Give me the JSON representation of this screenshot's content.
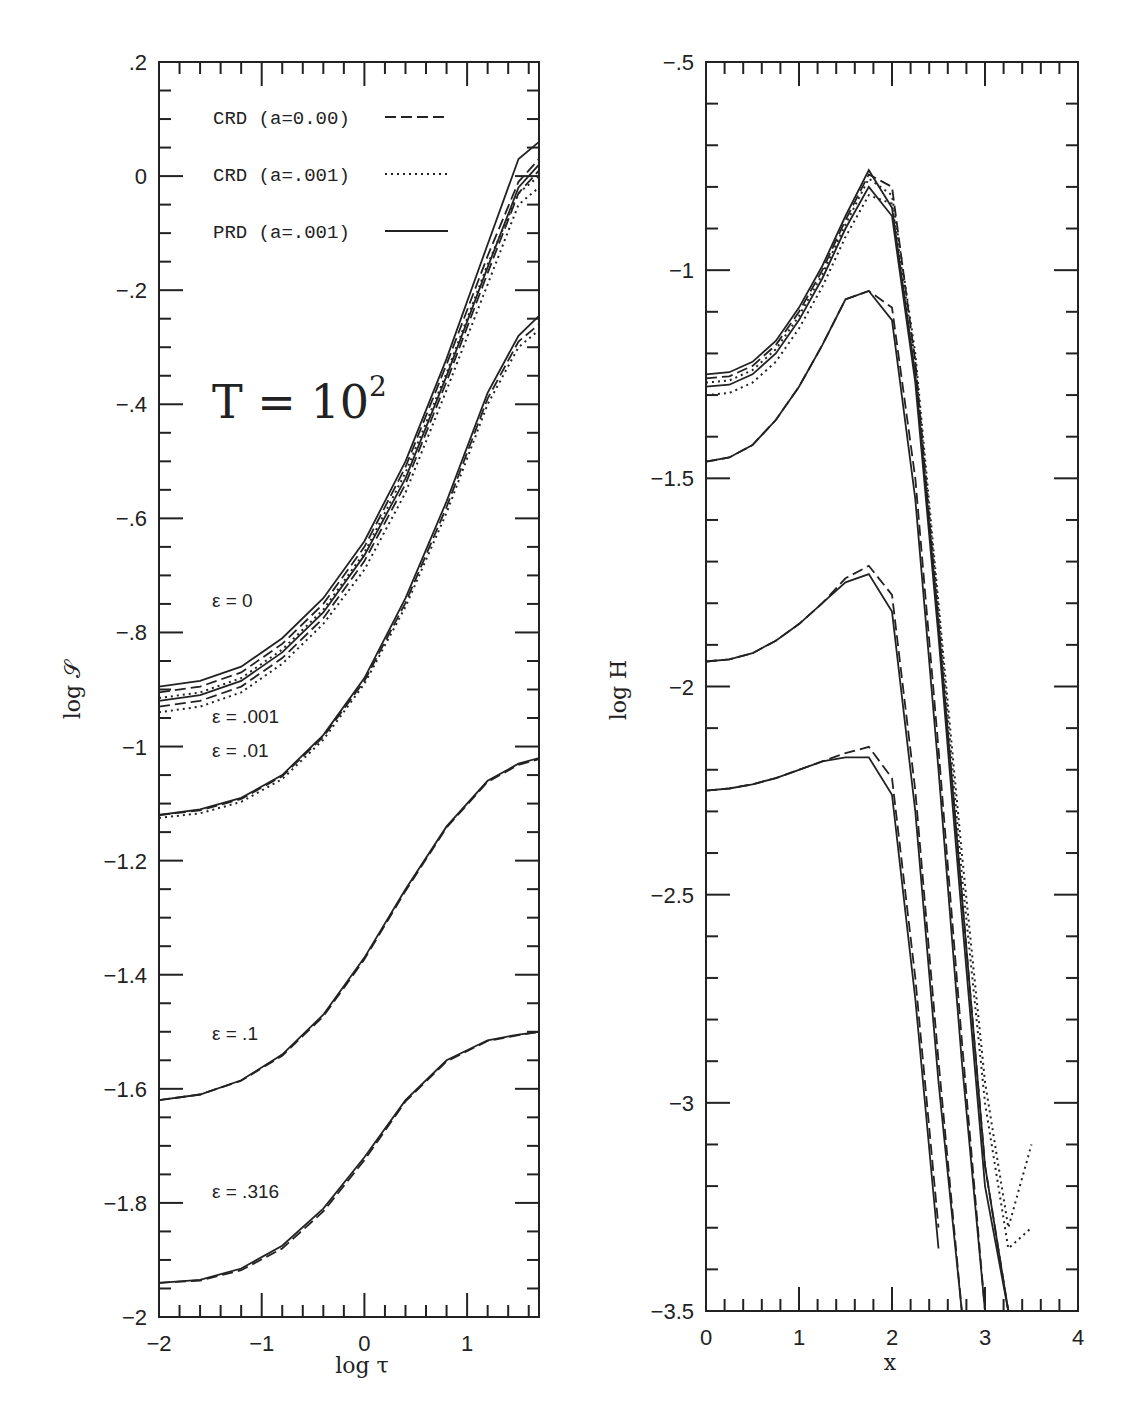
{
  "figure": {
    "left_panel": {
      "xlabel": "log τ",
      "ylabel": "log 𝒮",
      "annotation_big": "T = 10",
      "annotation_big_sup": "2",
      "legend": [
        {
          "label": "CRD (a=0.00)",
          "style": "dashed"
        },
        {
          "label": "CRD (a=.001)",
          "style": "dotted"
        },
        {
          "label": "PRD (a=.001)",
          "style": "solid"
        }
      ],
      "epsilon_labels": [
        "ε = 0",
        "ε = .001",
        "ε = .01",
        "ε = .1",
        "ε = .316"
      ]
    },
    "right_panel": {
      "xlabel": "x",
      "ylabel": "log H"
    }
  },
  "chart_data": [
    {
      "type": "line",
      "title": "T = 10^2",
      "xlabel": "log τ",
      "ylabel": "log 𝒮",
      "xlim": [
        -2,
        1.7
      ],
      "ylim": [
        -2,
        0.2
      ],
      "xticks": [
        "-2",
        "-1",
        "0",
        "1"
      ],
      "yticks": [
        ".2",
        "0",
        "-.2",
        "-.4",
        "-.6",
        "-.8",
        "-1",
        "-1.2",
        "-1.4",
        "-1.6",
        "-1.8",
        "-2"
      ],
      "grid": false,
      "legend_position": "upper left",
      "legend": [
        "CRD (a=0.00)",
        "CRD (a=.001)",
        "PRD (a=.001)"
      ],
      "annotations": [
        "T = 10^2",
        "ε = 0",
        "ε = .001",
        "ε = .01",
        "ε = .1",
        "ε = .316"
      ],
      "x": [
        -2.0,
        -1.6,
        -1.2,
        -0.8,
        -0.4,
        0.0,
        0.4,
        0.8,
        1.2,
        1.5,
        1.7
      ],
      "series": [
        {
          "name": "ε=0 PRD",
          "style": "solid",
          "values": [
            -0.895,
            -0.885,
            -0.86,
            -0.81,
            -0.74,
            -0.64,
            -0.5,
            -0.32,
            -0.12,
            0.03,
            0.06
          ]
        },
        {
          "name": "ε=0 CRD a=0",
          "style": "dashed",
          "values": [
            -0.905,
            -0.895,
            -0.87,
            -0.82,
            -0.75,
            -0.65,
            -0.51,
            -0.33,
            -0.14,
            -0.01,
            0.03
          ]
        },
        {
          "name": "ε=0 CRD a=.001",
          "style": "dotted",
          "values": [
            -0.915,
            -0.905,
            -0.88,
            -0.83,
            -0.76,
            -0.66,
            -0.52,
            -0.345,
            -0.155,
            -0.03,
            0.0
          ]
        },
        {
          "name": "ε=.001 PRD",
          "style": "solid",
          "values": [
            -0.92,
            -0.91,
            -0.885,
            -0.835,
            -0.765,
            -0.665,
            -0.53,
            -0.35,
            -0.16,
            -0.02,
            0.02
          ]
        },
        {
          "name": "ε=.001 CRD a=0",
          "style": "dashed",
          "values": [
            -0.93,
            -0.92,
            -0.895,
            -0.845,
            -0.775,
            -0.675,
            -0.54,
            -0.36,
            -0.17,
            -0.03,
            0.01
          ]
        },
        {
          "name": "ε=.001 CRD a=.001",
          "style": "dotted",
          "values": [
            -0.94,
            -0.93,
            -0.905,
            -0.855,
            -0.785,
            -0.69,
            -0.555,
            -0.375,
            -0.19,
            -0.05,
            -0.02
          ]
        },
        {
          "name": "ε=.01 PRD",
          "style": "solid",
          "values": [
            -1.12,
            -1.11,
            -1.09,
            -1.05,
            -0.98,
            -0.88,
            -0.74,
            -0.57,
            -0.38,
            -0.28,
            -0.245
          ]
        },
        {
          "name": "ε=.01 CRD a=0",
          "style": "dashed",
          "values": [
            -1.12,
            -1.112,
            -1.092,
            -1.052,
            -0.983,
            -0.885,
            -0.748,
            -0.58,
            -0.39,
            -0.29,
            -0.26
          ]
        },
        {
          "name": "ε=.01 CRD a=.001",
          "style": "dotted",
          "values": [
            -1.125,
            -1.117,
            -1.097,
            -1.057,
            -0.988,
            -0.89,
            -0.755,
            -0.59,
            -0.4,
            -0.3,
            -0.27
          ]
        },
        {
          "name": "ε=.1 PRD",
          "style": "solid",
          "values": [
            -1.62,
            -1.61,
            -1.585,
            -1.54,
            -1.47,
            -1.37,
            -1.25,
            -1.14,
            -1.06,
            -1.03,
            -1.02
          ]
        },
        {
          "name": "ε=.1 CRD a=0",
          "style": "dashed",
          "values": [
            -1.62,
            -1.61,
            -1.586,
            -1.542,
            -1.473,
            -1.373,
            -1.253,
            -1.142,
            -1.062,
            -1.032,
            -1.022
          ]
        },
        {
          "name": "ε=.316 PRD",
          "style": "solid",
          "values": [
            -1.94,
            -1.935,
            -1.915,
            -1.875,
            -1.81,
            -1.72,
            -1.62,
            -1.55,
            -1.515,
            -1.505,
            -1.5
          ]
        },
        {
          "name": "ε=.316 CRD a=0",
          "style": "dashed",
          "values": [
            -1.94,
            -1.936,
            -1.918,
            -1.88,
            -1.815,
            -1.725,
            -1.622,
            -1.552,
            -1.516,
            -1.506,
            -1.5
          ]
        }
      ]
    },
    {
      "type": "line",
      "title": "",
      "xlabel": "x",
      "ylabel": "log H",
      "xlim": [
        0,
        4
      ],
      "ylim": [
        -3.5,
        -0.5
      ],
      "xticks": [
        "0",
        "1",
        "2",
        "3",
        "4"
      ],
      "yticks": [
        "-.5",
        "-1",
        "-1.5",
        "-2",
        "-2.5",
        "-3",
        "-3.5"
      ],
      "grid": false,
      "x": [
        0.0,
        0.25,
        0.5,
        0.75,
        1.0,
        1.25,
        1.5,
        1.75,
        2.0,
        2.25,
        2.5,
        2.75,
        3.0,
        3.25,
        3.5
      ],
      "series": [
        {
          "name": "ε=0 PRD",
          "style": "solid",
          "values": [
            -1.25,
            -1.245,
            -1.22,
            -1.17,
            -1.09,
            -0.99,
            -0.87,
            -0.76,
            -0.85,
            -1.25,
            -1.85,
            -2.5,
            -3.15,
            -3.8,
            null
          ]
        },
        {
          "name": "ε=0 CRD a=0",
          "style": "dashed",
          "values": [
            -1.26,
            -1.255,
            -1.23,
            -1.18,
            -1.1,
            -1.0,
            -0.88,
            -0.77,
            -0.8,
            -1.22,
            -1.85,
            -2.5,
            -3.15,
            -3.8,
            null
          ]
        },
        {
          "name": "ε=0 CRD a=.001",
          "style": "dotted",
          "values": [
            -1.27,
            -1.265,
            -1.24,
            -1.19,
            -1.11,
            -1.01,
            -0.89,
            -0.78,
            -0.82,
            -1.2,
            -1.8,
            -2.4,
            -2.95,
            -3.3,
            -3.1
          ]
        },
        {
          "name": "ε=.001 PRD",
          "style": "solid",
          "values": [
            -1.28,
            -1.275,
            -1.25,
            -1.2,
            -1.12,
            -1.02,
            -0.9,
            -0.8,
            -0.87,
            -1.27,
            -1.88,
            -2.55,
            -3.2,
            -3.85,
            null
          ]
        },
        {
          "name": "ε=.001 CRD a=.001",
          "style": "dotted",
          "values": [
            -1.3,
            -1.295,
            -1.27,
            -1.22,
            -1.14,
            -1.04,
            -0.92,
            -0.82,
            -0.84,
            -1.22,
            -1.82,
            -2.45,
            -3.0,
            -3.35,
            -3.3
          ]
        },
        {
          "name": "ε=.01 PRD",
          "style": "solid",
          "values": [
            -1.46,
            -1.45,
            -1.42,
            -1.36,
            -1.28,
            -1.18,
            -1.07,
            -1.05,
            -1.12,
            -1.55,
            -2.2,
            -2.9,
            -3.55,
            null,
            null
          ]
        },
        {
          "name": "ε=.01 CRD a=0",
          "style": "dashed",
          "values": [
            -1.46,
            -1.45,
            -1.42,
            -1.36,
            -1.28,
            -1.18,
            -1.07,
            -1.05,
            -1.09,
            -1.5,
            -2.15,
            -2.85,
            -3.5,
            null,
            null
          ]
        },
        {
          "name": "ε=.1 PRD",
          "style": "solid",
          "values": [
            -1.94,
            -1.935,
            -1.92,
            -1.89,
            -1.85,
            -1.8,
            -1.75,
            -1.73,
            -1.82,
            -2.3,
            -2.95,
            -3.55,
            null,
            null,
            null
          ]
        },
        {
          "name": "ε=.1 CRD a=0",
          "style": "dashed",
          "values": [
            -1.94,
            -1.935,
            -1.92,
            -1.89,
            -1.85,
            -1.8,
            -1.74,
            -1.71,
            -1.78,
            -2.25,
            -2.9,
            -3.5,
            null,
            null,
            null
          ]
        },
        {
          "name": "ε=.316 PRD",
          "style": "solid",
          "values": [
            -2.25,
            -2.245,
            -2.235,
            -2.22,
            -2.2,
            -2.18,
            -2.17,
            -2.17,
            -2.26,
            -2.75,
            -3.35,
            null,
            null,
            null,
            null
          ]
        },
        {
          "name": "ε=.316 CRD a=0",
          "style": "dashed",
          "values": [
            -2.25,
            -2.245,
            -2.235,
            -2.22,
            -2.2,
            -2.18,
            -2.16,
            -2.145,
            -2.22,
            -2.7,
            -3.3,
            null,
            null,
            null,
            null
          ]
        }
      ]
    }
  ]
}
